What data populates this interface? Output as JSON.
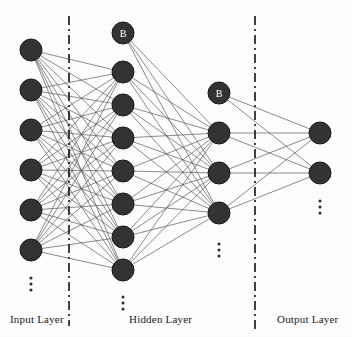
{
  "diagram": {
    "type": "neural-network",
    "canvas": {
      "width": 352,
      "height": 337
    },
    "colors": {
      "node_fill": "#333333",
      "node_stroke": "#1a1a1a",
      "edge": "#555555",
      "divider": "#111111",
      "background": "#fdfdfd",
      "label_text": "#1a1a1a",
      "bias_text": "#ffffff"
    },
    "node_radius": 11,
    "labels": {
      "input": "Input Layer",
      "hidden": "Hidden Layer",
      "output": "Output Layer"
    },
    "ellipsis_glyph": "⋮",
    "bias_label": "B",
    "layers": [
      {
        "id": "input",
        "name": "Input Layer",
        "x": 31,
        "node_count_shown": 6,
        "has_bias": false,
        "has_ellipsis": true,
        "ellipsis_y": 278,
        "nodes": [
          {
            "id": "i1",
            "cy": 50,
            "label": ""
          },
          {
            "id": "i2",
            "cy": 90,
            "label": ""
          },
          {
            "id": "i3",
            "cy": 130,
            "label": ""
          },
          {
            "id": "i4",
            "cy": 170,
            "label": ""
          },
          {
            "id": "i5",
            "cy": 210,
            "label": ""
          },
          {
            "id": "i6",
            "cy": 250,
            "label": ""
          }
        ]
      },
      {
        "id": "hidden1",
        "name": "Hidden Layer",
        "x": 123,
        "node_count_shown": 7,
        "has_bias": true,
        "has_ellipsis": true,
        "ellipsis_y": 297,
        "nodes": [
          {
            "id": "h0",
            "cy": 33,
            "label": "B"
          },
          {
            "id": "h1",
            "cy": 72,
            "label": ""
          },
          {
            "id": "h2",
            "cy": 105,
            "label": ""
          },
          {
            "id": "h3",
            "cy": 138,
            "label": ""
          },
          {
            "id": "h4",
            "cy": 171,
            "label": ""
          },
          {
            "id": "h5",
            "cy": 204,
            "label": ""
          },
          {
            "id": "h6",
            "cy": 237,
            "label": ""
          },
          {
            "id": "h7",
            "cy": 270,
            "label": ""
          }
        ]
      },
      {
        "id": "hidden2",
        "name": "Hidden Layer",
        "x": 219,
        "node_count_shown": 4,
        "has_bias": true,
        "has_ellipsis": true,
        "ellipsis_y": 244,
        "nodes": [
          {
            "id": "g0",
            "cy": 93,
            "label": "B"
          },
          {
            "id": "g1",
            "cy": 133,
            "label": ""
          },
          {
            "id": "g2",
            "cy": 173,
            "label": ""
          },
          {
            "id": "g3",
            "cy": 213,
            "label": ""
          }
        ]
      },
      {
        "id": "output",
        "name": "Output Layer",
        "x": 320,
        "node_count_shown": 2,
        "has_bias": false,
        "has_ellipsis": true,
        "ellipsis_y": 201,
        "nodes": [
          {
            "id": "o1",
            "cy": 133,
            "label": ""
          },
          {
            "id": "o2",
            "cy": 173,
            "label": ""
          }
        ]
      }
    ],
    "dividers": [
      {
        "id": "divider-left",
        "x": 69,
        "y1": 16,
        "y2": 326
      },
      {
        "id": "divider-right",
        "x": 255,
        "y1": 16,
        "y2": 330
      }
    ],
    "connections": [
      {
        "from_layer": "input",
        "to_layer": "hidden1",
        "style": "fully-connected"
      },
      {
        "from_layer": "hidden1",
        "to_layer": "hidden2",
        "style": "fully-connected"
      },
      {
        "from_layer": "hidden2",
        "to_layer": "output",
        "style": "fully-connected"
      }
    ]
  }
}
